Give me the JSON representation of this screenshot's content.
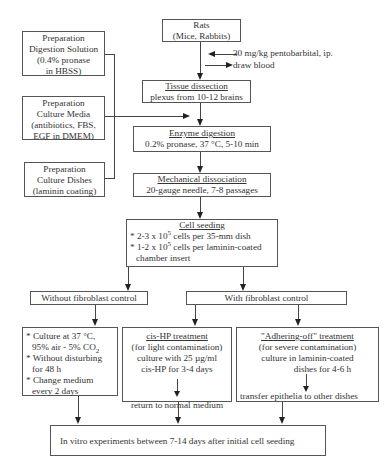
{
  "start": {
    "line1": "Rats",
    "line2": "(Mice, Rabbits)"
  },
  "side_notes": {
    "anesthesia": "30 mg/kg pentobarbital, ip.",
    "blood": "draw blood"
  },
  "preparations": [
    {
      "line1": "Preparation",
      "line2": "Digestion Solution",
      "line3": "(0.4% pronase",
      "line4": "in HBSS)"
    },
    {
      "line1": "Preparation",
      "line2": "Culture Media",
      "line3": "(antibiotics, FBS,",
      "line4": "EGF in DMEM)"
    },
    {
      "line1": "Preparation",
      "line2": "Culture Dishes",
      "line3": "(laminin coating)"
    }
  ],
  "steps": {
    "tissue": {
      "title": "Tissue dissection",
      "detail": "plexus from 10-12 brains"
    },
    "enzyme": {
      "title": "Enzyme  digestion",
      "detail": "0.2% pronase, 37   °C, 5-10 min"
    },
    "mechanical": {
      "title": "Mechanical dissociation",
      "detail": "20-gauge needle, 7-8 passages"
    },
    "seeding": {
      "title": "Cell seeding",
      "item1_pre": "* 2-3 x 10",
      "item1_exp": "5",
      "item1_post": " cells per 35-mm dish",
      "item2_pre": "* 1-2 x 10",
      "item2_exp": "5",
      "item2_post": " cells per laminin-coated",
      "item2_cont": "chamber insert"
    }
  },
  "branches": {
    "without": "Without fibroblast control",
    "with": "With fibroblast control"
  },
  "culture": {
    "b1_pre": "* Culture at 37  °C,",
    "b1_line2": "95% air - 5% CO",
    "b1_sub": "2",
    "b2": "* Without disturbing",
    "b2_cont": "for 48 h",
    "b3": "* Change medium",
    "b3_cont": "every 2 days"
  },
  "cishp": {
    "title": "cis-HP treatment",
    "l1": "(for light contamination)",
    "l2": "culture with 25 µg/ml",
    "l3": "cis-HP for 3-4 days",
    "result": "return to normal medium"
  },
  "adhering": {
    "title": "\"Adhering-off\"  treatment",
    "l1": "(for severe contamination)",
    "l2": "culture in laminin-coated",
    "l3": "dishes for 4-6 h",
    "result": "transfer epithelia to other dishes"
  },
  "final": {
    "text": "In vitro experiments between 7-14 days after initial cell seeding"
  }
}
